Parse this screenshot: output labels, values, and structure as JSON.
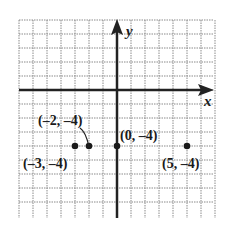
{
  "chart_data": {
    "type": "scatter",
    "title": "",
    "xlabel": "x",
    "ylabel": "y",
    "xlim": [
      -7,
      7
    ],
    "ylim": [
      -9,
      5
    ],
    "grid": true,
    "series": [
      {
        "name": "points",
        "points": [
          {
            "x": -3,
            "y": -4,
            "label": "(–3, –4)"
          },
          {
            "x": -2,
            "y": -4,
            "label": "(–2, –4)"
          },
          {
            "x": 0,
            "y": -4,
            "label": "(0, –4)"
          },
          {
            "x": 5,
            "y": -4,
            "label": "(5, –4)"
          }
        ]
      }
    ]
  },
  "labels": {
    "x_axis": "x",
    "y_axis": "y",
    "p1": "(–3, –4)",
    "p2": "(–2, –4)",
    "p3": "(0, –4)",
    "p4": "(5, –4)"
  }
}
